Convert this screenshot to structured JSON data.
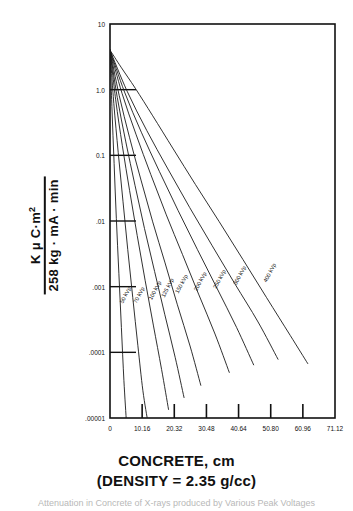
{
  "axis_label_y": {
    "numerator": "K μ C·m",
    "numerator_exp": "2",
    "denominator": "258 kg · mA · min"
  },
  "title_lines": {
    "line1": "CONCRETE, cm",
    "line2": "(DENSITY = 2.35 g/cc)"
  },
  "partial_caption": "Attenuation in Concrete of X-rays produced by Various Peak Voltages",
  "colors": {
    "ink": "#111111",
    "curve": "#1a1a1a",
    "background": "#ffffff"
  },
  "chart_data": {
    "type": "line",
    "title": "CONCRETE, cm",
    "subtitle": "(DENSITY = 2.35 g/cc)",
    "xlabel": "CONCRETE, cm",
    "ylabel": "K μ C·m² / 258 kg · mA · min",
    "xscale": "linear",
    "yscale": "log",
    "xlim": [
      0,
      71.12
    ],
    "ylim": [
      1e-05,
      10
    ],
    "grid": false,
    "legend": "inline-curve-labels",
    "xticks": [
      0,
      10.16,
      20.32,
      30.48,
      40.64,
      50.8,
      60.96,
      71.12
    ],
    "xtick_labels": [
      "0",
      "10.16",
      "20.32",
      "30.48",
      "40.64",
      "50.80",
      "60.96",
      "71.12"
    ],
    "yticks": [
      10,
      1.0,
      0.1,
      0.01,
      0.001,
      0.0001,
      1e-05
    ],
    "ytick_labels": [
      "10",
      "1.0",
      "0.1",
      ".01",
      ".001",
      ".0001",
      ".00001"
    ],
    "series": [
      {
        "name": "50 kVp",
        "label": "50 kVp",
        "x": [
          0.0,
          0.6,
          1.3,
          2.0,
          2.8,
          3.6,
          4.4,
          5.2
        ],
        "y": [
          4.0,
          0.55,
          0.075,
          0.011,
          0.0016,
          0.00024,
          3.7e-05,
          8.5e-06
        ]
      },
      {
        "name": "70 kVp",
        "label": "70 kVp",
        "x": [
          0.0,
          1.2,
          2.6,
          4.1,
          5.6,
          7.2,
          8.8,
          10.4,
          12.0
        ],
        "y": [
          4.0,
          0.62,
          0.11,
          0.02,
          0.0037,
          0.00068,
          0.000128,
          2.6e-05,
          8.5e-06
        ]
      },
      {
        "name": "100 kVp",
        "label": "100 kVp",
        "x": [
          0.0,
          1.8,
          3.9,
          6.2,
          8.6,
          11.1,
          13.7,
          16.3,
          18.5
        ],
        "y": [
          4.0,
          0.7,
          0.14,
          0.029,
          0.006,
          0.00125,
          0.00026,
          5.5e-05,
          1.35e-05
        ]
      },
      {
        "name": "125 kVp",
        "label": "125 kVp",
        "x": [
          0.0,
          2.3,
          5.0,
          7.9,
          10.9,
          14.1,
          17.3,
          20.6,
          23.4
        ],
        "y": [
          4.0,
          0.76,
          0.16,
          0.035,
          0.0077,
          0.0017,
          0.00038,
          8.4e-05,
          2.05e-05
        ]
      },
      {
        "name": "150 kVp",
        "label": "150 kVp",
        "x": [
          0.0,
          2.9,
          6.2,
          9.8,
          13.5,
          17.4,
          21.3,
          25.3,
          28.7
        ],
        "y": [
          4.0,
          0.82,
          0.185,
          0.042,
          0.0097,
          0.0023,
          0.00053,
          0.000125,
          3.15e-05
        ]
      },
      {
        "name": "200 kVp",
        "label": "200 kVp",
        "x": [
          0.0,
          3.8,
          8.2,
          12.9,
          17.8,
          22.9,
          28.0,
          33.2,
          37.7
        ],
        "y": [
          4.0,
          0.88,
          0.21,
          0.051,
          0.0124,
          0.0031,
          0.00077,
          0.00019,
          4.95e-05
        ]
      },
      {
        "name": "250 kVp",
        "label": "250 kVp",
        "x": [
          0.0,
          4.6,
          9.9,
          15.6,
          21.5,
          27.6,
          33.8,
          40.0,
          45.4
        ],
        "y": [
          4.0,
          0.92,
          0.225,
          0.057,
          0.0145,
          0.0037,
          0.00095,
          0.00024,
          6.45e-05
        ]
      },
      {
        "name": "300 kVp",
        "label": "300 kVp",
        "x": [
          0.0,
          5.4,
          11.6,
          18.3,
          25.2,
          32.3,
          39.5,
          46.8,
          53.1
        ],
        "y": [
          4.0,
          0.95,
          0.24,
          0.062,
          0.016,
          0.0042,
          0.0011,
          0.00029,
          7.85e-05
        ]
      },
      {
        "name": "400 kVp",
        "label": "400 kVp",
        "x": [
          0.0,
          3.5,
          8.0,
          13.5,
          20.0,
          27.0,
          34.5,
          42.0,
          49.5,
          57.0,
          62.5
        ],
        "y": [
          4.0,
          2.2,
          1.05,
          0.4,
          0.125,
          0.036,
          0.0098,
          0.0026,
          0.00068,
          0.00018,
          6.75e-05
        ]
      }
    ],
    "curve_label_positions": [
      {
        "name": "50 kVp",
        "x": 4.1,
        "y": 0.00055
      },
      {
        "name": "70 kVp",
        "x": 8.4,
        "y": 0.00055
      },
      {
        "name": "100 kVp",
        "x": 13.2,
        "y": 0.00062
      },
      {
        "name": "125 kVp",
        "x": 17.2,
        "y": 0.00068
      },
      {
        "name": "150 kVp",
        "x": 21.6,
        "y": 0.00078
      },
      {
        "name": "200 kVp",
        "x": 27.5,
        "y": 0.00085
      },
      {
        "name": "250 kVp",
        "x": 33.6,
        "y": 0.00092
      },
      {
        "name": "300 kVp",
        "x": 40.0,
        "y": 0.00105
      },
      {
        "name": "400 kVp",
        "x": 49.5,
        "y": 0.00115
      }
    ]
  }
}
